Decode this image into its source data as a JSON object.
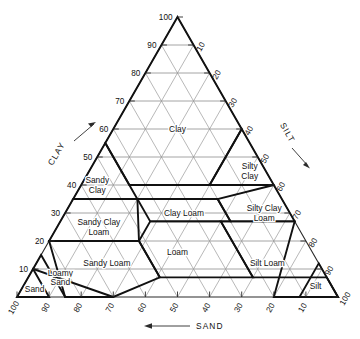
{
  "chart_data": {
    "type": "diagram",
    "axes": {
      "clay": {
        "name": "CLAY",
        "arrow": "up-right",
        "ticks": [
          10,
          20,
          30,
          40,
          50,
          60,
          70,
          80,
          90,
          100
        ],
        "tick_labels": [
          "10",
          "20",
          "30",
          "40",
          "50",
          "60",
          "70",
          "80",
          "90",
          "100"
        ],
        "position": "left"
      },
      "silt": {
        "name": "SILT",
        "arrow": "down-right",
        "ticks": [
          10,
          20,
          30,
          40,
          50,
          60,
          70,
          80,
          90,
          100
        ],
        "tick_labels": [
          "10",
          "20",
          "30",
          "40",
          "50",
          "60",
          "70",
          "80",
          "90",
          "100"
        ],
        "position": "right"
      },
      "sand": {
        "name": "SAND",
        "arrow": "left",
        "ticks": [
          10,
          20,
          30,
          40,
          50,
          60,
          70,
          80,
          90,
          100
        ],
        "tick_labels": [
          "100",
          "90",
          "80",
          "70",
          "60",
          "50",
          "40",
          "30",
          "20",
          "10"
        ],
        "position": "bottom"
      }
    },
    "grid_interval": 10,
    "classes": [
      {
        "name": "Clay",
        "label": "Clay",
        "label_pos": {
          "sand": 20,
          "silt": 20,
          "clay": 60
        },
        "polygon": [
          {
            "sand": 0,
            "silt": 0,
            "clay": 100
          },
          {
            "sand": 45,
            "silt": 0,
            "clay": 55
          },
          {
            "sand": 45,
            "silt": 15,
            "clay": 40
          },
          {
            "sand": 20,
            "silt": 40,
            "clay": 40
          },
          {
            "sand": 0,
            "silt": 40,
            "clay": 60
          }
        ]
      },
      {
        "name": "Silty Clay",
        "label": "Silty Clay",
        "label_lines": [
          "Silty",
          "Clay"
        ],
        "label_pos": {
          "sand": 5,
          "silt": 50,
          "clay": 45
        },
        "polygon": [
          {
            "sand": 0,
            "silt": 40,
            "clay": 60
          },
          {
            "sand": 20,
            "silt": 40,
            "clay": 40
          },
          {
            "sand": 0,
            "silt": 60,
            "clay": 40
          }
        ]
      },
      {
        "name": "Sandy Clay",
        "label": "Sandy Clay",
        "label_lines": [
          "Sandy",
          "Clay"
        ],
        "label_pos": {
          "sand": 55,
          "silt": 5,
          "clay": 40
        },
        "polygon": [
          {
            "sand": 45,
            "silt": 0,
            "clay": 55
          },
          {
            "sand": 65,
            "silt": 0,
            "clay": 35
          },
          {
            "sand": 45,
            "silt": 20,
            "clay": 35
          }
        ]
      },
      {
        "name": "Clay Loam",
        "label": "Clay Loam",
        "label_pos": {
          "sand": 33,
          "silt": 37,
          "clay": 30
        },
        "polygon": [
          {
            "sand": 20,
            "silt": 45,
            "clay": 35
          },
          {
            "sand": 45,
            "silt": 20,
            "clay": 35
          },
          {
            "sand": 45,
            "silt": 28,
            "clay": 27
          },
          {
            "sand": 20,
            "silt": 53,
            "clay": 27
          }
        ]
      },
      {
        "name": "Silty Clay Loam",
        "label": "Silty Clay Loam",
        "label_lines": [
          "Silty Clay",
          "Loam"
        ],
        "label_pos": {
          "sand": 8,
          "silt": 62,
          "clay": 30
        },
        "polygon": [
          {
            "sand": 0,
            "silt": 60,
            "clay": 40
          },
          {
            "sand": 20,
            "silt": 45,
            "clay": 35
          },
          {
            "sand": 20,
            "silt": 53,
            "clay": 27
          },
          {
            "sand": 0,
            "silt": 73,
            "clay": 27
          }
        ]
      },
      {
        "name": "Sandy Clay Loam",
        "label": "Sandy Clay Loam",
        "label_lines": [
          "Sandy Clay",
          "Loam"
        ],
        "label_pos": {
          "sand": 62,
          "silt": 13,
          "clay": 25
        },
        "polygon": [
          {
            "sand": 45,
            "silt": 20,
            "clay": 35
          },
          {
            "sand": 65,
            "silt": 0,
            "clay": 35
          },
          {
            "sand": 80,
            "silt": 0,
            "clay": 20
          },
          {
            "sand": 52,
            "silt": 28,
            "clay": 20
          }
        ]
      },
      {
        "name": "Loam",
        "label": "Loam",
        "label_pos": {
          "sand": 42,
          "silt": 42,
          "clay": 16
        },
        "polygon": [
          {
            "sand": 52,
            "silt": 28,
            "clay": 20
          },
          {
            "sand": 45,
            "silt": 28,
            "clay": 27
          },
          {
            "sand": 23,
            "silt": 50,
            "clay": 27
          },
          {
            "sand": 23,
            "silt": 70,
            "clay": 7
          },
          {
            "sand": 43,
            "silt": 50,
            "clay": 7
          },
          {
            "sand": 52,
            "silt": 41,
            "clay": 7
          }
        ]
      },
      {
        "name": "Silt Loam",
        "label": "Silt Loam",
        "label_pos": {
          "sand": 16,
          "silt": 72,
          "clay": 12
        },
        "polygon": [
          {
            "sand": 0,
            "silt": 73,
            "clay": 27
          },
          {
            "sand": 23,
            "silt": 50,
            "clay": 27
          },
          {
            "sand": 23,
            "silt": 70,
            "clay": 7
          },
          {
            "sand": 0,
            "silt": 93,
            "clay": 7
          },
          {
            "sand": 0,
            "silt": 100,
            "clay": 0
          },
          {
            "sand": 20,
            "silt": 80,
            "clay": 0
          }
        ]
      },
      {
        "name": "Silt",
        "label": "Silt",
        "label_pos": {
          "sand": 5,
          "silt": 91,
          "clay": 4
        },
        "polygon": [
          {
            "sand": 0,
            "silt": 88,
            "clay": 12
          },
          {
            "sand": 12,
            "silt": 88,
            "clay": 0
          },
          {
            "sand": 0,
            "silt": 100,
            "clay": 0
          }
        ]
      },
      {
        "name": "Sandy Loam",
        "label": "Sandy Loam",
        "label_pos": {
          "sand": 66,
          "silt": 22,
          "clay": 12
        },
        "polygon": [
          {
            "sand": 80,
            "silt": 0,
            "clay": 20
          },
          {
            "sand": 52,
            "silt": 28,
            "clay": 20
          },
          {
            "sand": 52,
            "silt": 41,
            "clay": 7
          },
          {
            "sand": 70,
            "silt": 30,
            "clay": 0
          },
          {
            "sand": 85,
            "silt": 15,
            "clay": 0
          }
        ]
      },
      {
        "name": "Loamy Sand",
        "label": "Loamy Sand",
        "label_lines": [
          "Loamy",
          "Sand"
        ],
        "label_pos": {
          "sand": 83,
          "silt": 10,
          "clay": 7
        },
        "polygon": [
          {
            "sand": 85,
            "silt": 15,
            "clay": 0
          },
          {
            "sand": 70,
            "silt": 30,
            "clay": 0
          },
          {
            "sand": 90,
            "silt": 0,
            "clay": 10
          },
          {
            "sand": 85,
            "silt": 0,
            "clay": 15
          }
        ]
      },
      {
        "name": "Sand",
        "label": "Sand",
        "label_pos": {
          "sand": 93,
          "silt": 4,
          "clay": 3
        },
        "polygon": [
          {
            "sand": 100,
            "silt": 0,
            "clay": 0
          },
          {
            "sand": 90,
            "silt": 10,
            "clay": 0
          },
          {
            "sand": 90,
            "silt": 0,
            "clay": 10
          }
        ]
      }
    ],
    "class_labels_visible": [
      "Clay",
      "Silty Clay",
      "Sandy Clay",
      "Clay Loam",
      "Silty Clay Loam",
      "Sandy Clay Loam",
      "Loam",
      "Silt Loam",
      "Silt",
      "Sandy Loam",
      "Loamy Sand",
      "Sand"
    ]
  },
  "colors": {
    "background": "#ffffff",
    "grid": "#9a9a9a",
    "outline": "#2b2b2b",
    "boundary": "#111111",
    "text": "#111111"
  }
}
